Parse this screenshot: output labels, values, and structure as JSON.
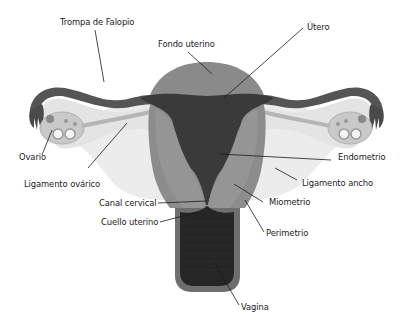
{
  "diagram": {
    "labels": {
      "trompa": "Trompa de Falopio",
      "fondo": "Fondo uterino",
      "utero": "Útero",
      "ovario": "Ovario",
      "ligamento_ovarico": "Ligamento ovárico",
      "endometrio": "Endometrio",
      "ligamento_ancho": "Ligamento ancho",
      "miometrio": "Miometrio",
      "canal_cervical": "Canal cervical",
      "cuello_uterino": "Cuello uterino",
      "perimetrio": "Perimetrio",
      "vagina": "Vagina"
    },
    "colors": {
      "background": "#ffffff",
      "fundus": "#8a8a8a",
      "myometrium": "#8c8c8c",
      "endometrium": "#3a3a3a",
      "tube_outer": "#555555",
      "tube_inner": "#e4e4e4",
      "broad_ligament": "#ececec",
      "ligament_band": "#b5b5b5",
      "ovary": "#cfcfcf",
      "vagina": "#262626",
      "perimetrium": "#6e6e6e",
      "leader_line": "#1a1a1a"
    }
  }
}
